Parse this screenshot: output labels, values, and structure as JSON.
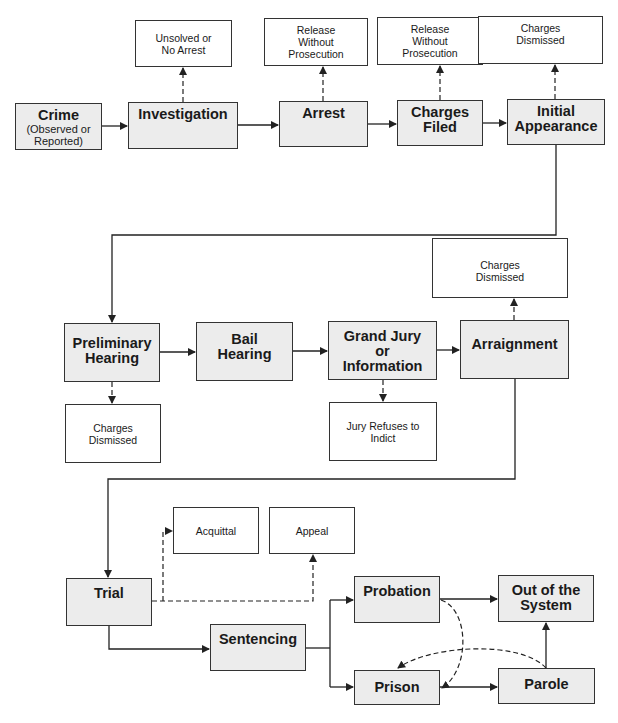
{
  "diagram": {
    "type": "flowchart",
    "main_steps": [
      {
        "id": "crime",
        "label": "Crime",
        "sublabel": "(Observed or Reported)"
      },
      {
        "id": "investigation",
        "label": "Investigation"
      },
      {
        "id": "arrest",
        "label": "Arrest"
      },
      {
        "id": "charges_filed",
        "label": "Charges Filed"
      },
      {
        "id": "initial_appearance",
        "label": "Initial Appearance"
      },
      {
        "id": "preliminary_hearing",
        "label": "Preliminary Hearing"
      },
      {
        "id": "bail_hearing",
        "label": "Bail Hearing"
      },
      {
        "id": "grand_jury",
        "label": "Grand Jury or Information"
      },
      {
        "id": "arraignment",
        "label": "Arraignment"
      },
      {
        "id": "trial",
        "label": "Trial"
      },
      {
        "id": "sentencing",
        "label": "Sentencing"
      },
      {
        "id": "probation",
        "label": "Probation"
      },
      {
        "id": "prison",
        "label": "Prison"
      },
      {
        "id": "parole",
        "label": "Parole"
      },
      {
        "id": "out_of_system",
        "label": "Out of the System"
      }
    ],
    "exit_outcomes": [
      {
        "id": "unsolved",
        "label": "Unsolved or No Arrest",
        "from": "investigation"
      },
      {
        "id": "release1",
        "label": "Release Without Prosecution",
        "from": "arrest"
      },
      {
        "id": "release2",
        "label": "Release Without Prosecution",
        "from": "charges_filed"
      },
      {
        "id": "dismissed1",
        "label": "Charges Dismissed",
        "from": "initial_appearance"
      },
      {
        "id": "dismissed2",
        "label": "Charges Dismissed",
        "from": "arraignment"
      },
      {
        "id": "dismissed3",
        "label": "Charges Dismissed",
        "from": "preliminary_hearing"
      },
      {
        "id": "jury_refuses",
        "label": "Jury Refuses to Indict",
        "from": "grand_jury"
      },
      {
        "id": "acquittal",
        "label": "Acquittal",
        "from": "trial"
      },
      {
        "id": "appeal",
        "label": "Appeal",
        "from": "trial"
      }
    ],
    "edges": [
      {
        "from": "crime",
        "to": "investigation",
        "style": "solid"
      },
      {
        "from": "investigation",
        "to": "arrest",
        "style": "solid"
      },
      {
        "from": "arrest",
        "to": "charges_filed",
        "style": "solid"
      },
      {
        "from": "charges_filed",
        "to": "initial_appearance",
        "style": "solid"
      },
      {
        "from": "initial_appearance",
        "to": "preliminary_hearing",
        "style": "solid"
      },
      {
        "from": "preliminary_hearing",
        "to": "bail_hearing",
        "style": "solid"
      },
      {
        "from": "bail_hearing",
        "to": "grand_jury",
        "style": "solid"
      },
      {
        "from": "grand_jury",
        "to": "arraignment",
        "style": "solid"
      },
      {
        "from": "arraignment",
        "to": "trial",
        "style": "solid"
      },
      {
        "from": "trial",
        "to": "sentencing",
        "style": "solid"
      },
      {
        "from": "sentencing",
        "to": "probation",
        "style": "solid"
      },
      {
        "from": "sentencing",
        "to": "prison",
        "style": "solid"
      },
      {
        "from": "probation",
        "to": "out_of_system",
        "style": "solid"
      },
      {
        "from": "prison",
        "to": "parole",
        "style": "solid"
      },
      {
        "from": "parole",
        "to": "out_of_system",
        "style": "solid"
      },
      {
        "from": "probation",
        "to": "prison",
        "style": "dashed"
      },
      {
        "from": "parole",
        "to": "prison",
        "style": "dashed"
      },
      {
        "from": "investigation",
        "to": "unsolved",
        "style": "dashed"
      },
      {
        "from": "arrest",
        "to": "release1",
        "style": "dashed"
      },
      {
        "from": "charges_filed",
        "to": "release2",
        "style": "dashed"
      },
      {
        "from": "initial_appearance",
        "to": "dismissed1",
        "style": "dashed"
      },
      {
        "from": "arraignment",
        "to": "dismissed2",
        "style": "dashed"
      },
      {
        "from": "preliminary_hearing",
        "to": "dismissed3",
        "style": "dashed"
      },
      {
        "from": "grand_jury",
        "to": "jury_refuses",
        "style": "dashed"
      },
      {
        "from": "trial",
        "to": "acquittal",
        "style": "dashed"
      },
      {
        "from": "trial",
        "to": "appeal",
        "style": "dashed"
      }
    ]
  },
  "labels": {
    "crime": "Crime",
    "crime_sub1": "(Observed or",
    "crime_sub2": "Reported)",
    "investigation": "Investigation",
    "arrest": "Arrest",
    "charges_filed_1": "Charges",
    "charges_filed_2": "Filed",
    "initial_appearance_1": "Initial",
    "initial_appearance_2": "Appearance",
    "preliminary_1": "Preliminary",
    "preliminary_2": "Hearing",
    "bail_1": "Bail",
    "bail_2": "Hearing",
    "grand_jury_1": "Grand Jury",
    "grand_jury_2": "or",
    "grand_jury_3": "Information",
    "arraignment": "Arraignment",
    "trial": "Trial",
    "sentencing": "Sentencing",
    "probation": "Probation",
    "prison": "Prison",
    "parole": "Parole",
    "out_1": "Out of the",
    "out_2": "System",
    "unsolved_1": "Unsolved or",
    "unsolved_2": "No Arrest",
    "release_1": "Release",
    "release_2": "Without",
    "release_3": "Prosecution",
    "dismissed_1": "Charges",
    "dismissed_2": "Dismissed",
    "jury_refuses_1": "Jury Refuses to",
    "jury_refuses_2": "Indict",
    "acquittal": "Acquittal",
    "appeal": "Appeal"
  },
  "colors": {
    "step_fill": "#ececec",
    "outcome_fill": "#ffffff",
    "line": "#222222"
  }
}
